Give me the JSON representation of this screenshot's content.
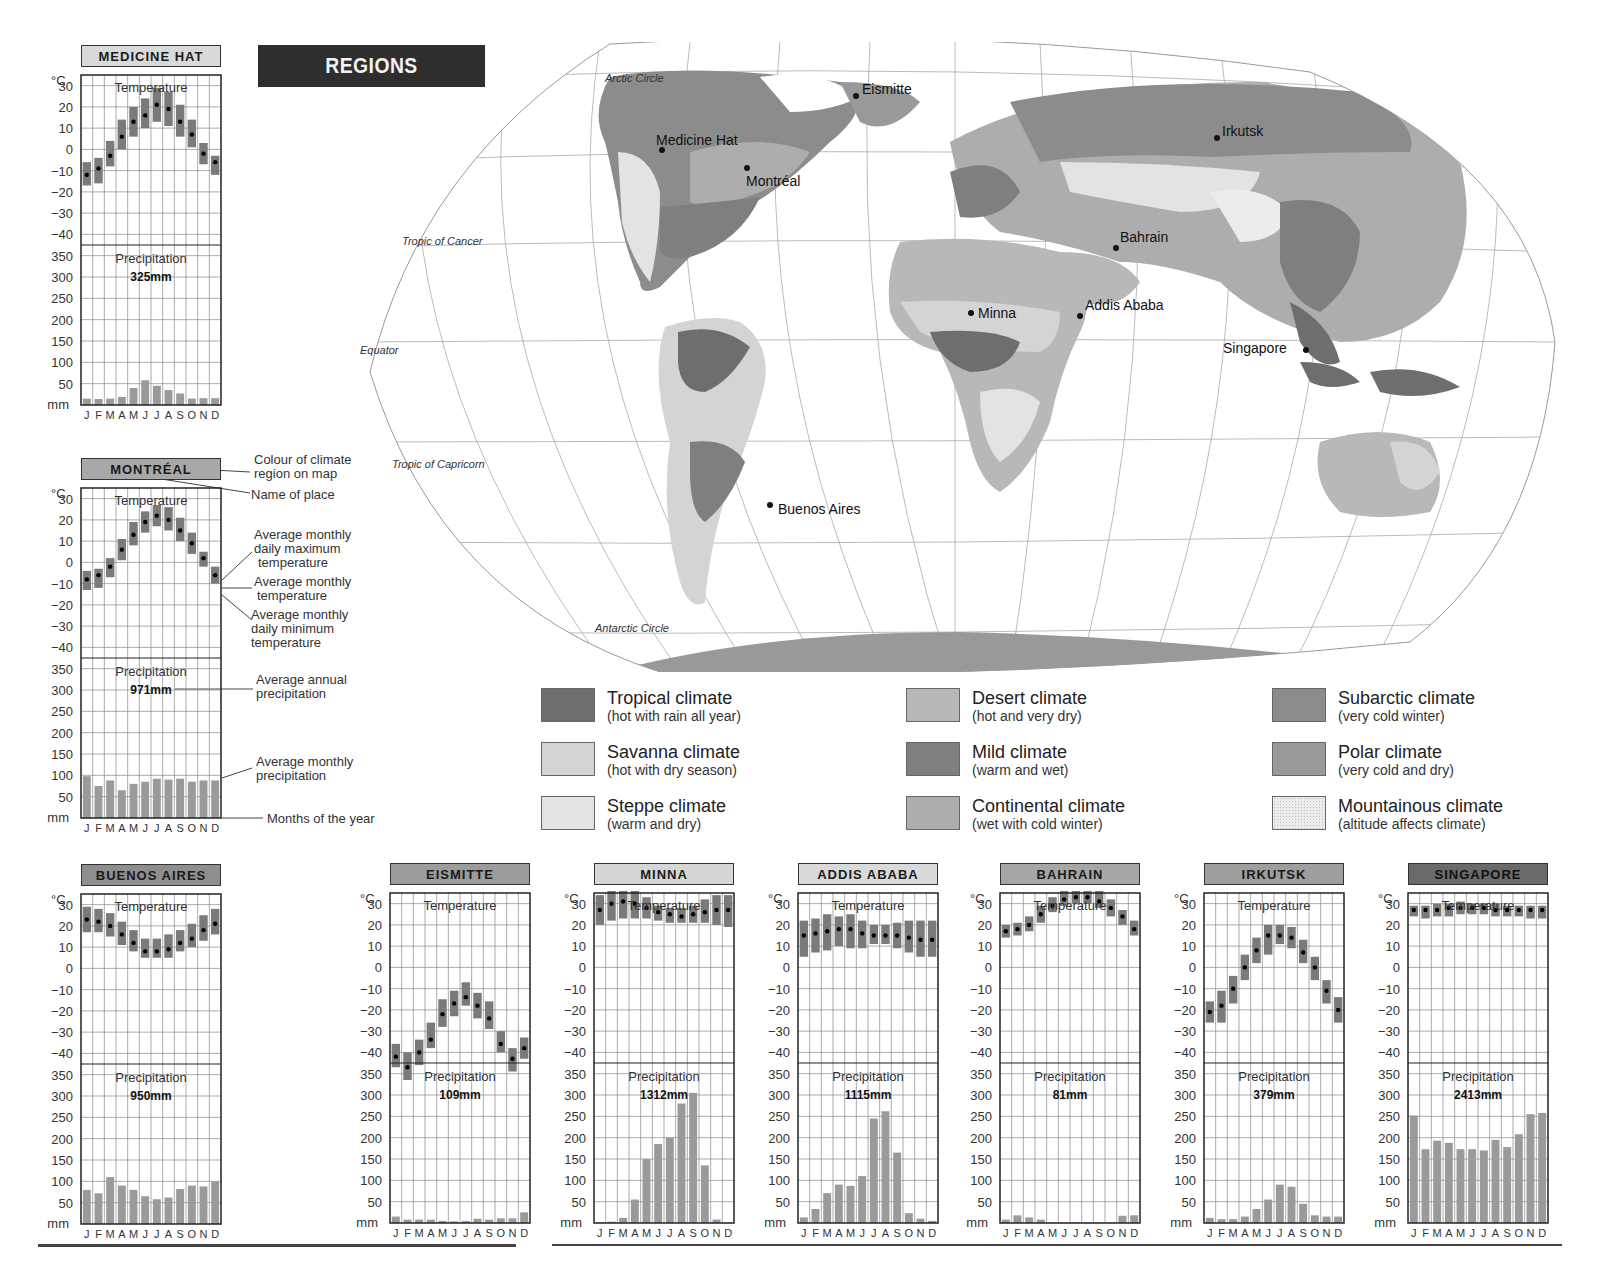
{
  "header": {
    "title": "REGIONS"
  },
  "colors": {
    "tropical": "#6e6e6e",
    "savanna": "#d4d4d4",
    "steppe": "#e3e3e3",
    "desert": "#b8b8b8",
    "mild": "#7f7f7f",
    "continental": "#adadad",
    "subarctic": "#8c8c8c",
    "polar": "#999999",
    "mountainous": "#ececec",
    "temp_bar": "#7a7a7a",
    "precip_bar": "#9a9a9a",
    "grid": "#888888"
  },
  "map": {
    "lines": {
      "arctic": "Arctic Circle",
      "cancer": "Tropic of Cancer",
      "equator": "Equator",
      "capricorn": "Tropic of Capricorn",
      "antarctic": "Antarctic Circle"
    },
    "places": [
      {
        "name": "Eismitte"
      },
      {
        "name": "Medicine Hat"
      },
      {
        "name": "Montréal"
      },
      {
        "name": "Irkutsk"
      },
      {
        "name": "Bahrain"
      },
      {
        "name": "Minna"
      },
      {
        "name": "Addis Ababa"
      },
      {
        "name": "Singapore"
      },
      {
        "name": "Buenos Aires"
      }
    ]
  },
  "legend": [
    {
      "name": "Tropical climate",
      "desc": "(hot with rain all year)"
    },
    {
      "name": "Savanna climate",
      "desc": "(hot with dry season)"
    },
    {
      "name": "Steppe climate",
      "desc": "(warm and dry)"
    },
    {
      "name": "Desert climate",
      "desc": "(hot and very dry)"
    },
    {
      "name": "Mild climate",
      "desc": "(warm and wet)"
    },
    {
      "name": "Continental climate",
      "desc": "(wet with cold winter)"
    },
    {
      "name": "Subarctic climate",
      "desc": "(very cold winter)"
    },
    {
      "name": "Polar climate",
      "desc": "(very cold and dry)"
    },
    {
      "name": "Mountainous climate",
      "desc": "(altitude affects climate)"
    }
  ],
  "annotations": {
    "colour": "Colour of climate region on map",
    "colour_l1": "Colour of climate",
    "colour_l2": "region on map",
    "name": "Name of place",
    "max_l1": "Average monthly",
    "max_l2": "daily maximum",
    "max_l3": "temperature",
    "avg_l1": "Average monthly",
    "avg_l2": "temperature",
    "min_l1": "Average monthly",
    "min_l2": "daily minimum",
    "min_l3": "temperature",
    "annual_l1": "Average annual",
    "annual_l2": "precipitation",
    "monthly_l1": "Average monthly",
    "monthly_l2": "precipitation",
    "months": "Months of the year"
  },
  "chart_labels": {
    "temp_unit": "°C",
    "precip_unit": "mm",
    "temp_title": "Temperature",
    "precip_title": "Precipitation",
    "temp_ticks": [
      "30",
      "20",
      "10",
      "0",
      "−10",
      "−20",
      "−30",
      "−40"
    ],
    "precip_ticks": [
      "350",
      "300",
      "250",
      "200",
      "150",
      "100",
      "50"
    ],
    "months": [
      "J",
      "F",
      "M",
      "A",
      "M",
      "J",
      "J",
      "A",
      "S",
      "O",
      "N",
      "D"
    ]
  },
  "chart_data": [
    {
      "type": "climate-chart",
      "title": "MEDICINE HAT",
      "label_color": "#d9d9d9",
      "annual_precip": "325mm",
      "months": [
        "J",
        "F",
        "M",
        "A",
        "M",
        "J",
        "J",
        "A",
        "S",
        "O",
        "N",
        "D"
      ],
      "temp_ylim": [
        -45,
        35
      ],
      "precip_ylim": [
        0,
        375
      ],
      "temp_mean": [
        -12,
        -9,
        -3,
        6,
        13,
        16,
        21,
        19,
        13,
        7,
        -2,
        -6
      ],
      "temp_max": [
        -6,
        -4,
        4,
        14,
        20,
        24,
        29,
        27,
        21,
        14,
        3,
        -3
      ],
      "temp_min": [
        -17,
        -16,
        -8,
        0,
        6,
        10,
        13,
        11,
        6,
        1,
        -7,
        -12
      ],
      "precip": [
        15,
        14,
        15,
        19,
        40,
        58,
        45,
        35,
        27,
        15,
        16,
        16
      ]
    },
    {
      "type": "climate-chart",
      "title": "MONTRÉAL",
      "label_color": "#a8a8a8",
      "annual_precip": "971mm",
      "months": [
        "J",
        "F",
        "M",
        "A",
        "M",
        "J",
        "J",
        "A",
        "S",
        "O",
        "N",
        "D"
      ],
      "temp_ylim": [
        -45,
        35
      ],
      "precip_ylim": [
        0,
        375
      ],
      "temp_mean": [
        -8,
        -6,
        -2,
        6,
        13,
        19,
        22,
        20,
        15,
        9,
        2,
        -6
      ],
      "temp_max": [
        -4,
        -3,
        2,
        11,
        19,
        24,
        27,
        26,
        21,
        14,
        5,
        -2
      ],
      "temp_min": [
        -13,
        -12,
        -7,
        1,
        8,
        14,
        17,
        15,
        10,
        4,
        -2,
        -10
      ],
      "precip": [
        98,
        75,
        88,
        65,
        80,
        85,
        92,
        90,
        92,
        85,
        88,
        88
      ]
    },
    {
      "type": "climate-chart",
      "title": "BUENOS AIRES",
      "label_color": "#8e8e8e",
      "annual_precip": "950mm",
      "months": [
        "J",
        "F",
        "M",
        "A",
        "M",
        "J",
        "J",
        "A",
        "S",
        "O",
        "N",
        "D"
      ],
      "temp_ylim": [
        -45,
        35
      ],
      "precip_ylim": [
        0,
        375
      ],
      "temp_mean": [
        23,
        22,
        20,
        16,
        12,
        8,
        8,
        9,
        12,
        14,
        18,
        21
      ],
      "temp_max": [
        29,
        28,
        26,
        22,
        18,
        14,
        14,
        16,
        18,
        21,
        25,
        28
      ],
      "temp_min": [
        17,
        17,
        15,
        11,
        8,
        5,
        5,
        5,
        8,
        10,
        13,
        16
      ],
      "precip": [
        80,
        72,
        110,
        90,
        80,
        65,
        58,
        62,
        82,
        90,
        88,
        100
      ]
    },
    {
      "type": "climate-chart",
      "title": "EISMITTE",
      "label_color": "#9c9c9c",
      "annual_precip": "109mm",
      "months": [
        "J",
        "F",
        "M",
        "A",
        "M",
        "J",
        "J",
        "A",
        "S",
        "O",
        "N",
        "D"
      ],
      "temp_ylim": [
        -45,
        35
      ],
      "precip_ylim": [
        0,
        375
      ],
      "temp_mean": [
        -42,
        -47,
        -40,
        -34,
        -22,
        -17,
        -14,
        -18,
        -24,
        -36,
        -43,
        -38
      ],
      "temp_max": [
        -36,
        -40,
        -34,
        -26,
        -15,
        -11,
        -7,
        -12,
        -16,
        -30,
        -38,
        -33
      ],
      "temp_min": [
        -47,
        -53,
        -46,
        -38,
        -28,
        -23,
        -18,
        -24,
        -29,
        -40,
        -49,
        -43
      ],
      "precip": [
        15,
        8,
        8,
        8,
        5,
        4,
        5,
        10,
        8,
        11,
        11,
        25
      ]
    },
    {
      "type": "climate-chart",
      "title": "MINNA",
      "label_color": "#d6d6d6",
      "annual_precip": "1312mm",
      "months": [
        "J",
        "F",
        "M",
        "A",
        "M",
        "J",
        "J",
        "A",
        "S",
        "O",
        "N",
        "D"
      ],
      "temp_ylim": [
        -45,
        35
      ],
      "precip_ylim": [
        0,
        375
      ],
      "temp_mean": [
        27,
        30,
        31,
        30,
        28,
        26,
        25,
        24,
        25,
        26,
        27,
        27
      ],
      "temp_max": [
        34,
        36,
        37,
        36,
        33,
        29,
        28,
        28,
        29,
        32,
        34,
        34
      ],
      "temp_min": [
        20,
        22,
        23,
        23,
        23,
        22,
        21,
        21,
        21,
        21,
        20,
        19
      ],
      "precip": [
        1,
        3,
        12,
        55,
        150,
        185,
        200,
        280,
        305,
        135,
        8,
        1
      ]
    },
    {
      "type": "climate-chart",
      "title": "ADDIS ABABA",
      "label_color": "#dadada",
      "annual_precip": "1115mm",
      "months": [
        "J",
        "F",
        "M",
        "A",
        "M",
        "J",
        "J",
        "A",
        "S",
        "O",
        "N",
        "D"
      ],
      "temp_ylim": [
        -45,
        35
      ],
      "precip_ylim": [
        0,
        375
      ],
      "temp_mean": [
        15,
        16,
        17,
        18,
        18,
        16,
        15,
        15,
        15,
        14,
        13,
        13
      ],
      "temp_max": [
        22,
        23,
        25,
        24,
        25,
        22,
        20,
        20,
        21,
        22,
        22,
        22
      ],
      "temp_min": [
        5,
        7,
        8,
        10,
        9,
        9,
        11,
        11,
        9,
        7,
        5,
        5
      ],
      "precip": [
        13,
        33,
        70,
        90,
        87,
        110,
        245,
        262,
        165,
        23,
        10,
        5
      ]
    },
    {
      "type": "climate-chart",
      "title": "BAHRAIN",
      "label_color": "#a6a6a6",
      "annual_precip": "81mm",
      "months": [
        "J",
        "F",
        "M",
        "A",
        "M",
        "J",
        "J",
        "A",
        "S",
        "O",
        "N",
        "D"
      ],
      "temp_ylim": [
        -45,
        35
      ],
      "precip_ylim": [
        0,
        375
      ],
      "temp_mean": [
        17,
        18,
        20,
        25,
        29,
        32,
        33,
        33,
        31,
        28,
        24,
        18
      ],
      "temp_max": [
        20,
        21,
        24,
        29,
        33,
        36,
        37,
        38,
        36,
        32,
        27,
        22
      ],
      "temp_min": [
        14,
        15,
        17,
        21,
        26,
        29,
        30,
        30,
        28,
        24,
        20,
        15
      ],
      "precip": [
        8,
        18,
        13,
        8,
        1,
        0,
        0,
        0,
        0,
        0,
        17,
        18
      ]
    },
    {
      "type": "climate-chart",
      "title": "IRKUTSK",
      "label_color": "#9e9e9e",
      "annual_precip": "379mm",
      "months": [
        "J",
        "F",
        "M",
        "A",
        "M",
        "J",
        "J",
        "A",
        "S",
        "O",
        "N",
        "D"
      ],
      "temp_ylim": [
        -45,
        35
      ],
      "precip_ylim": [
        0,
        375
      ],
      "temp_mean": [
        -21,
        -18,
        -10,
        0,
        8,
        15,
        15,
        14,
        7,
        0,
        -11,
        -20
      ],
      "temp_max": [
        -16,
        -11,
        -4,
        6,
        14,
        20,
        20,
        19,
        13,
        5,
        -6,
        -14
      ],
      "temp_min": [
        -26,
        -26,
        -17,
        -6,
        2,
        6,
        11,
        9,
        2,
        -6,
        -17,
        -26
      ],
      "precip": [
        12,
        9,
        9,
        15,
        33,
        55,
        90,
        85,
        45,
        18,
        15,
        15
      ]
    },
    {
      "type": "climate-chart",
      "title": "SINGAPORE",
      "label_color": "#6a6a6a",
      "annual_precip": "2413mm",
      "months": [
        "J",
        "F",
        "M",
        "A",
        "M",
        "J",
        "J",
        "A",
        "S",
        "O",
        "N",
        "D"
      ],
      "temp_ylim": [
        -45,
        35
      ],
      "precip_ylim": [
        0,
        375
      ],
      "temp_mean": [
        27,
        27,
        27,
        28,
        28,
        28,
        28,
        27,
        27,
        27,
        27,
        27
      ],
      "temp_max": [
        29,
        29,
        30,
        30,
        31,
        30,
        30,
        30,
        29,
        29,
        29,
        29
      ],
      "temp_min": [
        24,
        23,
        24,
        24,
        25,
        25,
        25,
        24,
        24,
        24,
        23,
        23
      ],
      "precip": [
        252,
        173,
        193,
        188,
        173,
        173,
        170,
        195,
        178,
        208,
        255,
        258
      ]
    }
  ]
}
